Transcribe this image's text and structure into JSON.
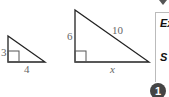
{
  "figures": {
    "small_triangle": {
      "leg_vertical": "3",
      "leg_horizontal": "4"
    },
    "large_triangle": {
      "leg_vertical": "6",
      "hypotenuse": "10",
      "leg_horizontal": "x"
    }
  },
  "side_panel": {
    "heading_1": "Ex",
    "heading_2": "S",
    "step_number": "1"
  }
}
